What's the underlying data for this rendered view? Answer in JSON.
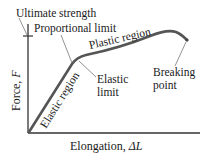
{
  "diagram": {
    "y_axis_label": "Force, ",
    "y_axis_var": "F",
    "x_axis_label": "Elongation, ",
    "x_axis_var": "ΔL",
    "annotations": {
      "ultimate_strength": "Ultimate strength",
      "proportional_limit": "Proportional limit",
      "plastic_region": "Plastic region",
      "elastic_region": "Elastic region",
      "elastic_limit_line1": "Elastic",
      "elastic_limit_line2": "limit",
      "breaking_point_line1": "Breaking",
      "breaking_point_line2": "point"
    },
    "colors": {
      "curve": "#555555",
      "axis": "#333333",
      "leader": "#777777",
      "text": "#1a1a1a"
    }
  }
}
